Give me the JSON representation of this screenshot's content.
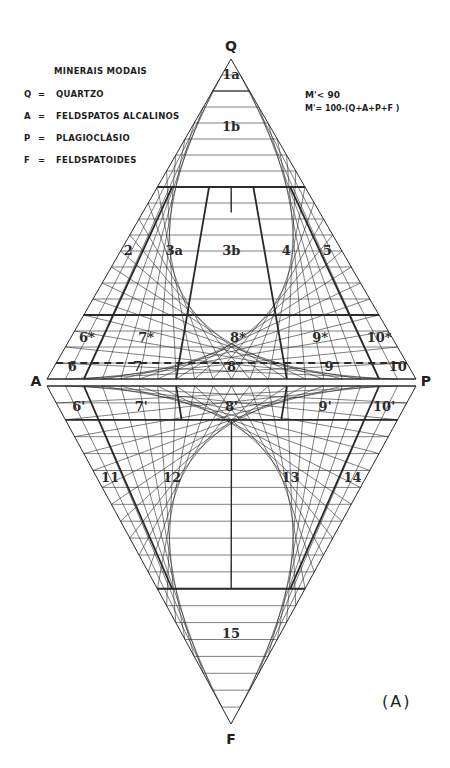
{
  "legend": {
    "title": "MINERAIS MODAIS",
    "items": [
      {
        "symbol": "Q",
        "sep": "=",
        "label": "QUARTZO"
      },
      {
        "symbol": "A",
        "sep": "=",
        "label": "FELDSPATOS ALCALINOS"
      },
      {
        "symbol": "P",
        "sep": "=",
        "label": "PLAGIOCLÁSIO"
      },
      {
        "symbol": "F",
        "sep": "=",
        "label": "FELDSPATOIDES"
      }
    ]
  },
  "m_note": {
    "line1": "M'< 90",
    "line2": "M'= 100-(Q+A+P+F )"
  },
  "figure_label": "(A)",
  "vertices": {
    "top": "Q",
    "left": "A",
    "right": "P",
    "bottom": "F"
  },
  "chart_data": {
    "type": "ternary-diamond",
    "grid_step_percent": 5,
    "upper_boundaries_Q_percent": [
      90,
      60,
      20,
      5
    ],
    "upper_dashed_Q_percent": 5,
    "lower_boundaries_F_percent": [
      10,
      60
    ],
    "ap_ratio_boundaries_percent": [
      10,
      35,
      65,
      90
    ],
    "fields": [
      {
        "id": "1a",
        "zone": "upper"
      },
      {
        "id": "1b",
        "zone": "upper"
      },
      {
        "id": "2",
        "zone": "upper"
      },
      {
        "id": "3a",
        "zone": "upper"
      },
      {
        "id": "3b",
        "zone": "upper"
      },
      {
        "id": "4",
        "zone": "upper"
      },
      {
        "id": "5",
        "zone": "upper"
      },
      {
        "id": "6*",
        "zone": "upper"
      },
      {
        "id": "7*",
        "zone": "upper"
      },
      {
        "id": "8*",
        "zone": "upper"
      },
      {
        "id": "9*",
        "zone": "upper"
      },
      {
        "id": "10*",
        "zone": "upper"
      },
      {
        "id": "6",
        "zone": "upper"
      },
      {
        "id": "7",
        "zone": "upper"
      },
      {
        "id": "8",
        "zone": "upper"
      },
      {
        "id": "9",
        "zone": "upper"
      },
      {
        "id": "10",
        "zone": "upper"
      },
      {
        "id": "6'",
        "zone": "lower"
      },
      {
        "id": "7'",
        "zone": "lower"
      },
      {
        "id": "8'",
        "zone": "lower"
      },
      {
        "id": "9'",
        "zone": "lower"
      },
      {
        "id": "10'",
        "zone": "lower"
      },
      {
        "id": "11",
        "zone": "lower"
      },
      {
        "id": "12",
        "zone": "lower"
      },
      {
        "id": "13",
        "zone": "lower"
      },
      {
        "id": "14",
        "zone": "lower"
      },
      {
        "id": "15",
        "zone": "lower"
      }
    ]
  }
}
